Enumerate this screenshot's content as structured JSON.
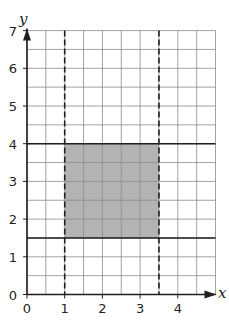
{
  "chart_data": {
    "type": "region",
    "title": "",
    "xlabel": "x",
    "ylabel": "y",
    "xlim": [
      0,
      5
    ],
    "ylim": [
      0,
      7
    ],
    "grid": true,
    "grid_spacing": 0.5,
    "x_ticks": [
      "0",
      "1",
      "2",
      "3",
      "4"
    ],
    "y_ticks": [
      "0",
      "1",
      "2",
      "3",
      "4",
      "5",
      "6",
      "7"
    ],
    "lines": [
      {
        "orientation": "vertical",
        "value": 1,
        "style": "dashed"
      },
      {
        "orientation": "vertical",
        "value": 3.5,
        "style": "dashed"
      },
      {
        "orientation": "horizontal",
        "value": 4,
        "style": "solid"
      },
      {
        "orientation": "horizontal",
        "value": 1.5,
        "style": "solid"
      }
    ],
    "shaded_region": {
      "x_min": 1,
      "x_max": 3.5,
      "y_min": 1.5,
      "y_max": 4,
      "color": "#b3b3b3"
    }
  },
  "colors": {
    "grid": "#8c8c8c",
    "axis": "#231f20",
    "shade": "#b3b3b3"
  }
}
